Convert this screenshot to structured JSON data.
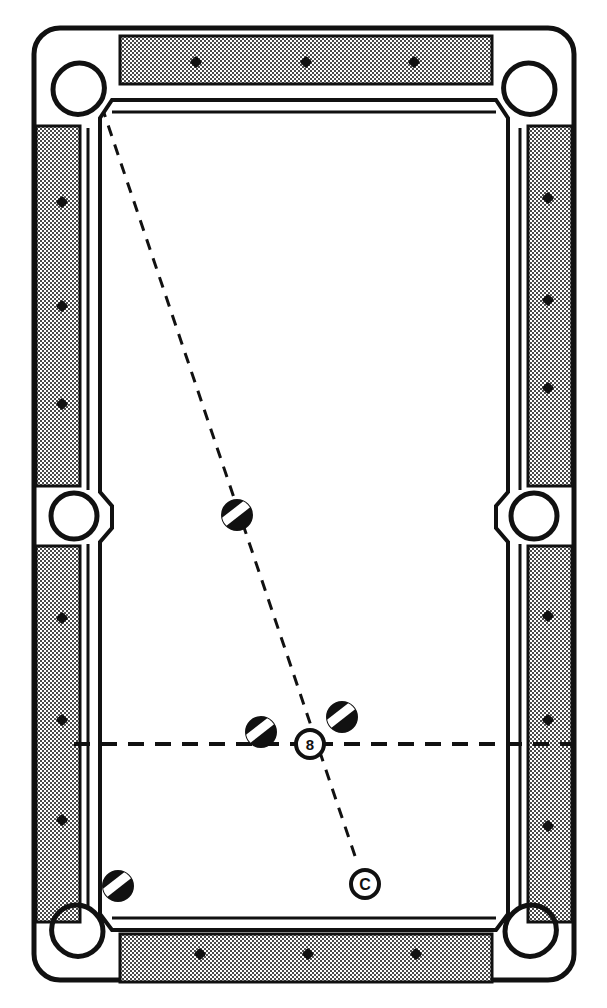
{
  "diagram": {
    "view": "overhead",
    "canvas": {
      "width": 607,
      "height": 1008
    },
    "colors": {
      "ink": "#111111",
      "cloth": "#ffffff",
      "rail_fill": "#b8b8b8",
      "ball_fill": "#111111",
      "ball_stripe": "#ffffff",
      "paper": "#ffffff"
    }
  },
  "table": {
    "frame_label": "table cushion frame",
    "outer": {
      "x": 34,
      "y": 28,
      "width": 540,
      "height": 952,
      "corner_radius": 26
    },
    "playfield": {
      "x": 74,
      "y": 94,
      "width": 460,
      "height": 820
    },
    "rails": [
      {
        "name": "top-rail",
        "orientation": "horizontal",
        "x": 120,
        "y": 36,
        "width": 372,
        "height": 48,
        "diamonds": 3
      },
      {
        "name": "bottom-rail",
        "orientation": "horizontal",
        "x": 120,
        "y": 934,
        "width": 372,
        "height": 48,
        "diamonds": 3
      },
      {
        "name": "left-upper-rail",
        "orientation": "vertical",
        "x": 36,
        "y": 126,
        "width": 44,
        "height": 360,
        "diamonds": 3
      },
      {
        "name": "left-lower-rail",
        "orientation": "vertical",
        "x": 36,
        "y": 546,
        "width": 44,
        "height": 376,
        "diamonds": 3
      },
      {
        "name": "right-upper-rail",
        "orientation": "vertical",
        "x": 528,
        "y": 126,
        "width": 44,
        "height": 360,
        "diamonds": 3
      },
      {
        "name": "right-lower-rail",
        "orientation": "vertical",
        "x": 528,
        "y": 546,
        "width": 44,
        "height": 376,
        "diamonds": 3
      }
    ],
    "diamond_markers": [
      {
        "rail": "top-rail",
        "index": 1,
        "x": 196,
        "y": 62
      },
      {
        "rail": "top-rail",
        "index": 2,
        "x": 306,
        "y": 62
      },
      {
        "rail": "top-rail",
        "index": 3,
        "x": 414,
        "y": 62
      },
      {
        "rail": "bottom-rail",
        "index": 1,
        "x": 200,
        "y": 954
      },
      {
        "rail": "bottom-rail",
        "index": 2,
        "x": 308,
        "y": 954
      },
      {
        "rail": "bottom-rail",
        "index": 3,
        "x": 416,
        "y": 954
      },
      {
        "rail": "left-upper-rail",
        "index": 1,
        "x": 62,
        "y": 202
      },
      {
        "rail": "left-upper-rail",
        "index": 2,
        "x": 62,
        "y": 306
      },
      {
        "rail": "left-upper-rail",
        "index": 3,
        "x": 62,
        "y": 404
      },
      {
        "rail": "left-lower-rail",
        "index": 1,
        "x": 62,
        "y": 618
      },
      {
        "rail": "left-lower-rail",
        "index": 2,
        "x": 62,
        "y": 720
      },
      {
        "rail": "left-lower-rail",
        "index": 3,
        "x": 62,
        "y": 820
      },
      {
        "rail": "right-upper-rail",
        "index": 1,
        "x": 548,
        "y": 198
      },
      {
        "rail": "right-upper-rail",
        "index": 2,
        "x": 548,
        "y": 300
      },
      {
        "rail": "right-upper-rail",
        "index": 3,
        "x": 548,
        "y": 388
      },
      {
        "rail": "right-lower-rail",
        "index": 1,
        "x": 548,
        "y": 616
      },
      {
        "rail": "right-lower-rail",
        "index": 2,
        "x": 548,
        "y": 720
      },
      {
        "rail": "right-lower-rail",
        "index": 3,
        "x": 548,
        "y": 826
      }
    ],
    "pockets": [
      {
        "name": "top-left-corner-pocket",
        "type": "corner",
        "cx": 78,
        "cy": 88,
        "r": 26
      },
      {
        "name": "top-right-corner-pocket",
        "type": "corner",
        "cx": 530,
        "cy": 88,
        "r": 26
      },
      {
        "name": "left-side-pocket",
        "type": "side",
        "cx": 74,
        "cy": 516,
        "r": 22
      },
      {
        "name": "right-side-pocket",
        "type": "side",
        "cx": 534,
        "cy": 516,
        "r": 22
      },
      {
        "name": "bottom-left-corner-pocket",
        "type": "corner",
        "cx": 78,
        "cy": 930,
        "r": 26
      },
      {
        "name": "bottom-right-corner-pocket",
        "type": "corner",
        "cx": 530,
        "cy": 930,
        "r": 26
      }
    ]
  },
  "balls": [
    {
      "name": "striped-ball-upper",
      "label": "",
      "type": "stripe",
      "cx": 237,
      "cy": 515,
      "r": 15,
      "stripe_angle": -38
    },
    {
      "name": "striped-ball-left-of-eight",
      "label": "",
      "type": "stripe",
      "cx": 261,
      "cy": 732,
      "r": 15,
      "stripe_angle": -38
    },
    {
      "name": "striped-ball-right-of-eight",
      "label": "",
      "type": "stripe",
      "cx": 342,
      "cy": 717,
      "r": 15,
      "stripe_angle": -38
    },
    {
      "name": "striped-ball-lower-left",
      "label": "",
      "type": "stripe",
      "cx": 118,
      "cy": 886,
      "r": 15,
      "stripe_angle": -38
    },
    {
      "name": "eight-ball",
      "label": "8",
      "type": "numbered-outline",
      "cx": 310,
      "cy": 744,
      "r": 14
    },
    {
      "name": "cue-ball",
      "label": "C",
      "type": "cue-outline",
      "cx": 365,
      "cy": 884,
      "r": 14
    }
  ],
  "lines": [
    {
      "name": "aim-line",
      "style": "dashed",
      "description": "cue ball through eight ball into top-left corner pocket",
      "x1": 355,
      "y1": 856,
      "x2": 104,
      "y2": 113
    },
    {
      "name": "center-string-line",
      "style": "dashed",
      "description": "horizontal center string across the table",
      "x1": 74,
      "y1": 744,
      "x2": 572,
      "y2": 744
    }
  ]
}
